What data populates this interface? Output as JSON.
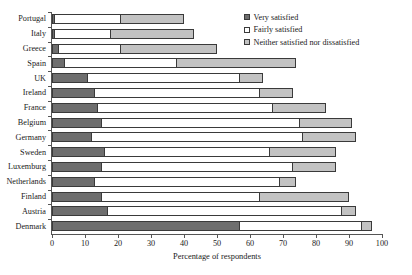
{
  "chart_data": {
    "type": "bar",
    "orientation": "horizontal",
    "stacked": true,
    "title": "",
    "xlabel": "Percentage of respondents",
    "ylabel": "",
    "xlim": [
      0,
      100
    ],
    "xticks": [
      0,
      10,
      20,
      30,
      40,
      50,
      60,
      70,
      80,
      90,
      100
    ],
    "grid": false,
    "legend_position": "top-right",
    "categories": [
      "Portugal",
      "Italy",
      "Greece",
      "Spain",
      "UK",
      "Ireland",
      "France",
      "Belgium",
      "Germany",
      "Sweden",
      "Luxemburg",
      "Netherlands",
      "Finland",
      "Austria",
      "Denmark"
    ],
    "series": [
      {
        "name": "Very satisfied",
        "color": "#6e6e6e",
        "values": [
          1,
          1,
          2,
          4,
          11,
          13,
          14,
          15,
          12,
          16,
          15,
          13,
          15,
          17,
          57
        ]
      },
      {
        "name": "Fairly satisfied",
        "color": "#ffffff",
        "values": [
          20,
          17,
          19,
          34,
          46,
          50,
          53,
          60,
          64,
          50,
          58,
          56,
          48,
          71,
          37
        ]
      },
      {
        "name": "Neither satisfied nor dissatisfied",
        "color": "#c2c2c2",
        "values": [
          19,
          25,
          29,
          36,
          7,
          10,
          16,
          16,
          16,
          20,
          13,
          5,
          27,
          4,
          3
        ]
      }
    ],
    "totals": [
      40,
      43,
      50,
      74,
      64,
      73,
      83,
      91,
      92,
      86,
      86,
      74,
      90,
      92,
      97
    ]
  },
  "legend": {
    "items": [
      {
        "label": "Very satisfied",
        "swatch": "#6e6e6e"
      },
      {
        "label": "Fairly satisfied",
        "swatch": "#ffffff"
      },
      {
        "label": "Neither satisfied nor dissatisfied",
        "swatch": "#c2c2c2"
      }
    ]
  },
  "axis": {
    "x_title": "Percentage of respondents"
  }
}
